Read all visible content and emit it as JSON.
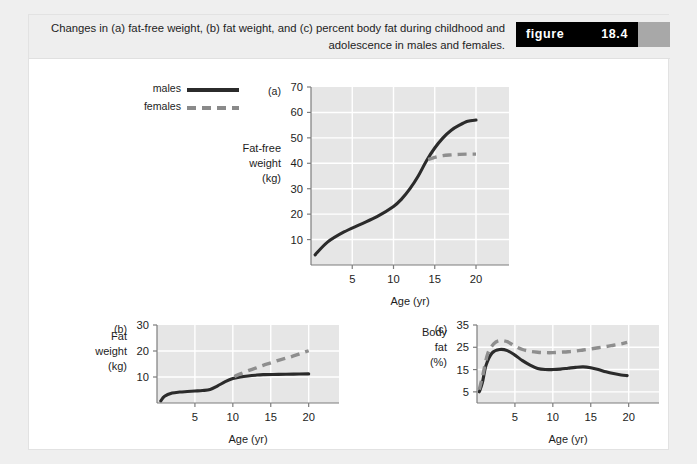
{
  "caption": {
    "text": "Changes in (a) fat-free weight, (b) fat weight, and (c) percent body fat during childhood and adolescence in males and females.",
    "figure_word": "figure",
    "figure_number": "18.4"
  },
  "legend": {
    "items": [
      {
        "label": "males",
        "style": "solid",
        "color": "#2b2b2b"
      },
      {
        "label": "females",
        "style": "dashed",
        "color": "#8e8e8e"
      }
    ]
  },
  "colors": {
    "page_background": "#efefef",
    "card_background": "#ffffff",
    "caption_background": "#eeeeee",
    "badge_background": "#000000",
    "badge_tab": "#a8a8a8",
    "plot_background": "#e6e6e6",
    "gridline": "#ffffff",
    "males": "#2b2b2b",
    "females": "#8e8e8e"
  },
  "chart_data": [
    {
      "id": "a",
      "type": "line",
      "panel_label": "(a)",
      "title": "",
      "xlabel": "Age (yr)",
      "ylabel": "Fat-free weight (kg)",
      "ylabel_lines": [
        "Fat-free",
        "weight",
        "(kg)"
      ],
      "xlim": [
        0,
        24
      ],
      "ylim": [
        0,
        70
      ],
      "xticks": [
        5,
        10,
        15,
        20
      ],
      "yticks": [
        10,
        20,
        30,
        40,
        50,
        60,
        70
      ],
      "grid": true,
      "legend_position": "external-top-left",
      "series": [
        {
          "name": "males",
          "style": "solid",
          "x": [
            0.5,
            2,
            4,
            6,
            8,
            10,
            11,
            12,
            13,
            14,
            15,
            16,
            17,
            18,
            19,
            20
          ],
          "values": [
            4,
            9,
            13,
            16,
            19,
            23,
            26,
            30,
            35,
            41,
            46,
            50,
            53,
            55,
            56.5,
            57
          ]
        },
        {
          "name": "females",
          "style": "dashed",
          "x": [
            14.2,
            15,
            16,
            17,
            18,
            19,
            20
          ],
          "values": [
            41.5,
            42.3,
            43,
            43.3,
            43.5,
            43.6,
            43.6
          ]
        }
      ]
    },
    {
      "id": "b",
      "type": "line",
      "panel_label": "(b)",
      "title": "",
      "xlabel": "Age (yr)",
      "ylabel": "Fat weight (kg)",
      "ylabel_lines": [
        "Fat",
        "weight",
        "(kg)"
      ],
      "xlim": [
        0,
        24
      ],
      "ylim": [
        0,
        30
      ],
      "xticks": [
        5,
        10,
        15,
        20
      ],
      "yticks": [
        10,
        20,
        30
      ],
      "grid": true,
      "series": [
        {
          "name": "males",
          "style": "solid",
          "x": [
            0.5,
            1,
            2,
            3,
            4,
            5,
            6,
            7,
            8,
            9,
            10,
            11,
            12,
            13,
            14,
            16,
            18,
            20
          ],
          "values": [
            0.8,
            2.6,
            3.8,
            4.2,
            4.4,
            4.6,
            4.8,
            5.2,
            6.6,
            8.2,
            9.4,
            10,
            10.4,
            10.7,
            10.9,
            11,
            11.1,
            11.2
          ]
        },
        {
          "name": "females",
          "style": "dashed",
          "x": [
            10.2,
            11,
            12,
            13,
            14,
            15,
            16,
            17,
            18,
            19,
            20
          ],
          "values": [
            10.2,
            11.2,
            12.4,
            13.4,
            14.5,
            15.4,
            16.4,
            17.2,
            18.1,
            19.1,
            20.1
          ]
        }
      ]
    },
    {
      "id": "c",
      "type": "line",
      "panel_label": "(c)",
      "title": "",
      "xlabel": "Age (yr)",
      "ylabel": "Body fat (%)",
      "ylabel_lines": [
        "Body",
        "fat",
        "(%)"
      ],
      "xlim": [
        0,
        24
      ],
      "ylim": [
        0,
        35
      ],
      "xticks": [
        5,
        10,
        15,
        20
      ],
      "yticks": [
        5,
        15,
        25,
        35
      ],
      "grid": true,
      "series": [
        {
          "name": "males",
          "style": "solid",
          "x": [
            0.3,
            0.7,
            1.2,
            2,
            3,
            4,
            5,
            6,
            7,
            8,
            9,
            10,
            11,
            12,
            13,
            14,
            15,
            16,
            17,
            18,
            19,
            19.8
          ],
          "values": [
            5,
            9,
            17,
            22.5,
            24,
            23.5,
            21.5,
            19,
            17,
            15.5,
            15,
            15,
            15.2,
            15.6,
            16,
            16.2,
            15.8,
            15,
            14,
            13.2,
            12.6,
            12.3
          ]
        },
        {
          "name": "females",
          "style": "dashed",
          "x": [
            0.3,
            0.8,
            1.4,
            2.2,
            3,
            4,
            5,
            6,
            7,
            8,
            9,
            10,
            11,
            12,
            13,
            14,
            15,
            16,
            17,
            18,
            19,
            19.8
          ],
          "values": [
            6,
            13,
            22,
            26.5,
            28,
            27.5,
            25.5,
            24,
            23.2,
            22.8,
            22.6,
            22.6,
            22.8,
            23,
            23.3,
            23.8,
            24.3,
            24.8,
            25.3,
            25.9,
            26.5,
            27.2
          ]
        }
      ]
    }
  ]
}
